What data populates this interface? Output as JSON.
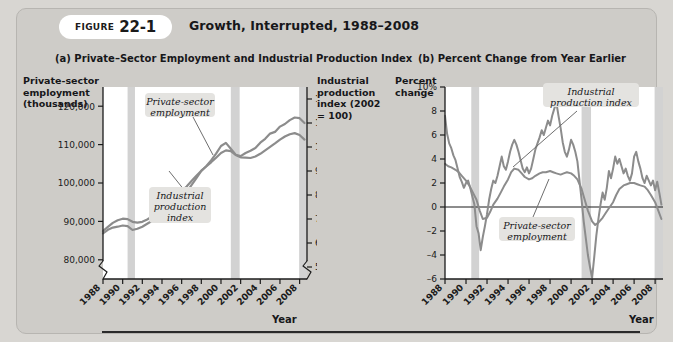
{
  "figure": {
    "label_word": "FIGURE",
    "number": "22-1",
    "title": "Growth, Interrupted, 1988–2008"
  },
  "panel_a": {
    "title": "(a) Private–Sector Employment and Industrial Production Index",
    "left_axis_caption": "Private-sector\nemployment\n(thousands)",
    "right_axis_caption": "Industrial\nproduction\nindex (2002\n= 100)",
    "x_axis_label": "Year",
    "callout_employment": "Private-sector\nemployment",
    "callout_ip": "Industrial\nproduction\nindex"
  },
  "panel_b": {
    "title": "(b) Percent Change from Year Earlier",
    "left_axis_caption": "Percent\nchange",
    "x_axis_label": "Year",
    "callout_ip": "Industrial\nproduction index",
    "callout_employment": "Private-sector\nemployment"
  },
  "colors": {
    "card_background": "#ceccc8",
    "page_background": "#d8d6d2",
    "plot_background": "#ffffff",
    "series_line": "#8c8c8c",
    "recession_band": "#d2d2d2",
    "axis": "#1b1b1b",
    "callout_box": "#e4e3e0"
  },
  "chart_data": [
    {
      "type": "line",
      "title": "(a) Private–Sector Employment and Industrial Production Index",
      "xlabel": "Year",
      "ylabel": "Private-sector employment (thousands)",
      "y2label": "Industrial production index (2002 = 100)",
      "xlim": [
        1988,
        2008.75
      ],
      "ylim": [
        75000,
        125000
      ],
      "y2lim": [
        45,
        125
      ],
      "yticks": [
        80000,
        90000,
        100000,
        110000,
        120000
      ],
      "yticklabels": [
        "80,000",
        "90,000",
        "100,000",
        "110,000",
        "120,000"
      ],
      "y2ticks": [
        50,
        60,
        70,
        80,
        90,
        100,
        110,
        120
      ],
      "y2ticklabels": [
        "50",
        "60",
        "70",
        "80",
        "90",
        "100",
        "110",
        "120"
      ],
      "xticks": [
        1988,
        1990,
        1992,
        1994,
        1996,
        1998,
        2000,
        2002,
        2004,
        2006,
        2008
      ],
      "xticklabels": [
        "1988",
        "1990",
        "1992",
        "1994",
        "1996",
        "1998",
        "2000",
        "2002",
        "2004",
        "2006",
        "2008"
      ],
      "grid": false,
      "axis_break": true,
      "legend": "inline-callout",
      "recession_bands": [
        [
          1990.5,
          1991.25
        ],
        [
          2001.0,
          2001.9
        ],
        [
          2007.95,
          2008.75
        ]
      ],
      "series": [
        {
          "name": "Private-sector employment",
          "axis": "left",
          "x": [
            1988.0,
            1988.5,
            1989.0,
            1989.5,
            1990.0,
            1990.5,
            1991.0,
            1991.5,
            1992.0,
            1992.5,
            1993.0,
            1993.5,
            1994.0,
            1994.5,
            1995.0,
            1995.5,
            1996.0,
            1996.5,
            1997.0,
            1997.5,
            1998.0,
            1998.5,
            1999.0,
            1999.5,
            2000.0,
            2000.5,
            2001.0,
            2001.5,
            2002.0,
            2002.5,
            2003.0,
            2003.5,
            2004.0,
            2004.5,
            2005.0,
            2005.5,
            2006.0,
            2006.5,
            2007.0,
            2007.5,
            2008.0,
            2008.5
          ],
          "y": [
            87500,
            88600,
            89600,
            90300,
            90700,
            90600,
            89900,
            89700,
            89900,
            90500,
            91300,
            92400,
            93600,
            94900,
            96000,
            96900,
            97900,
            99100,
            100500,
            101900,
            103200,
            104300,
            105400,
            106600,
            107800,
            108500,
            108300,
            107300,
            106700,
            106600,
            106500,
            106900,
            107600,
            108500,
            109400,
            110300,
            111300,
            112100,
            112700,
            113000,
            112500,
            111300
          ]
        },
        {
          "name": "Industrial production index",
          "axis": "right",
          "x": [
            1988.0,
            1988.5,
            1989.0,
            1989.5,
            1990.0,
            1990.5,
            1991.0,
            1991.5,
            1992.0,
            1992.5,
            1993.0,
            1993.5,
            1994.0,
            1994.5,
            1995.0,
            1995.5,
            1996.0,
            1996.5,
            1997.0,
            1997.5,
            1998.0,
            1998.5,
            1999.0,
            1999.5,
            2000.0,
            2000.5,
            2001.0,
            2001.5,
            2002.0,
            2002.5,
            2003.0,
            2003.5,
            2004.0,
            2004.5,
            2005.0,
            2005.5,
            2006.0,
            2006.5,
            2007.0,
            2007.5,
            2008.0,
            2008.5
          ],
          "y": [
            64.0,
            65.5,
            66.4,
            66.8,
            67.3,
            67.0,
            65.4,
            65.9,
            66.8,
            68.0,
            69.3,
            70.7,
            72.6,
            74.6,
            76.5,
            77.6,
            79.2,
            81.3,
            84.1,
            87.0,
            90.0,
            92.0,
            94.4,
            97.2,
            100.4,
            101.7,
            99.3,
            96.8,
            96.2,
            97.5,
            98.4,
            99.6,
            101.8,
            103.4,
            105.6,
            106.3,
            108.5,
            109.6,
            111.2,
            112.3,
            112.0,
            110.0
          ]
        }
      ]
    },
    {
      "type": "line",
      "title": "(b) Percent Change from Year Earlier",
      "xlabel": "Year",
      "ylabel": "Percent change",
      "xlim": [
        1988,
        2008.75
      ],
      "ylim": [
        -6,
        10
      ],
      "yticks": [
        -6,
        -4,
        -2,
        0,
        2,
        4,
        6,
        8,
        10
      ],
      "yticklabels": [
        "–6",
        "–4",
        "–2",
        "0",
        "2",
        "4",
        "6",
        "8",
        "10%"
      ],
      "xticks": [
        1988,
        1990,
        1992,
        1994,
        1996,
        1998,
        2000,
        2002,
        2004,
        2006,
        2008
      ],
      "xticklabels": [
        "1988",
        "1990",
        "1992",
        "1994",
        "1996",
        "1998",
        "2000",
        "2002",
        "2004",
        "2006",
        "2008"
      ],
      "grid": false,
      "zero_line": true,
      "legend": "inline-callout",
      "recession_bands": [
        [
          1990.5,
          1991.25
        ],
        [
          2001.0,
          2001.9
        ],
        [
          2007.95,
          2008.75
        ]
      ],
      "series": [
        {
          "name": "Private-sector employment",
          "x": [
            1988.0,
            1988.3,
            1988.6,
            1989.0,
            1989.3,
            1989.6,
            1990.0,
            1990.3,
            1990.6,
            1991.0,
            1991.3,
            1991.6,
            1992.0,
            1992.3,
            1992.6,
            1993.0,
            1993.3,
            1993.6,
            1994.0,
            1994.3,
            1994.6,
            1995.0,
            1995.3,
            1995.6,
            1996.0,
            1996.3,
            1996.6,
            1997.0,
            1997.3,
            1997.6,
            1998.0,
            1998.3,
            1998.6,
            1999.0,
            1999.3,
            1999.6,
            2000.0,
            2000.3,
            2000.6,
            2001.0,
            2001.3,
            2001.6,
            2002.0,
            2002.3,
            2002.6,
            2003.0,
            2003.3,
            2003.6,
            2004.0,
            2004.3,
            2004.6,
            2005.0,
            2005.3,
            2005.6,
            2006.0,
            2006.3,
            2006.6,
            2007.0,
            2007.3,
            2007.6,
            2008.0,
            2008.3,
            2008.6
          ],
          "y": [
            3.6,
            3.4,
            3.3,
            3.1,
            2.9,
            2.6,
            2.2,
            1.8,
            1.3,
            0.6,
            -0.3,
            -1.0,
            -0.9,
            -0.4,
            0.2,
            0.7,
            1.2,
            1.7,
            2.3,
            2.9,
            3.2,
            3.1,
            2.8,
            2.5,
            2.3,
            2.4,
            2.6,
            2.8,
            2.9,
            2.9,
            3.0,
            2.9,
            2.8,
            2.7,
            2.8,
            2.9,
            2.8,
            2.6,
            2.3,
            1.5,
            0.6,
            -0.3,
            -1.2,
            -1.5,
            -1.3,
            -0.9,
            -0.5,
            -0.1,
            0.4,
            1.0,
            1.5,
            1.8,
            1.9,
            2.0,
            2.0,
            1.9,
            1.8,
            1.7,
            1.4,
            1.0,
            0.4,
            -0.3,
            -1.0
          ]
        },
        {
          "name": "Industrial production index",
          "x": [
            1988.0,
            1988.2,
            1988.4,
            1988.6,
            1988.8,
            1989.0,
            1989.2,
            1989.4,
            1989.6,
            1989.8,
            1990.0,
            1990.2,
            1990.4,
            1990.6,
            1990.8,
            1991.0,
            1991.2,
            1991.4,
            1991.6,
            1991.8,
            1992.0,
            1992.2,
            1992.4,
            1992.6,
            1992.8,
            1993.0,
            1993.2,
            1993.4,
            1993.6,
            1993.8,
            1994.0,
            1994.2,
            1994.4,
            1994.6,
            1994.8,
            1995.0,
            1995.2,
            1995.4,
            1995.6,
            1995.8,
            1996.0,
            1996.2,
            1996.4,
            1996.6,
            1996.8,
            1997.0,
            1997.2,
            1997.4,
            1997.6,
            1997.8,
            1998.0,
            1998.2,
            1998.4,
            1998.6,
            1998.8,
            1999.0,
            1999.2,
            1999.4,
            1999.6,
            1999.8,
            2000.0,
            2000.2,
            2000.4,
            2000.6,
            2000.8,
            2001.0,
            2001.2,
            2001.4,
            2001.6,
            2001.8,
            2002.0,
            2002.2,
            2002.4,
            2002.6,
            2002.8,
            2003.0,
            2003.2,
            2003.4,
            2003.6,
            2003.8,
            2004.0,
            2004.2,
            2004.4,
            2004.6,
            2004.8,
            2005.0,
            2005.2,
            2005.4,
            2005.6,
            2005.8,
            2006.0,
            2006.2,
            2006.4,
            2006.6,
            2006.8,
            2007.0,
            2007.2,
            2007.4,
            2007.6,
            2007.8,
            2008.0,
            2008.2,
            2008.4,
            2008.6
          ],
          "y": [
            7.6,
            6.1,
            5.3,
            4.9,
            4.3,
            3.9,
            3.2,
            2.5,
            2.1,
            1.6,
            2.0,
            2.2,
            1.6,
            0.9,
            0.2,
            -1.6,
            -2.2,
            -3.6,
            -2.5,
            -1.6,
            -0.6,
            0.6,
            1.5,
            2.2,
            2.0,
            2.6,
            3.4,
            4.2,
            3.4,
            3.1,
            3.8,
            4.6,
            5.2,
            5.6,
            5.2,
            4.6,
            3.9,
            3.2,
            2.9,
            3.3,
            2.8,
            3.2,
            4.0,
            4.8,
            5.3,
            5.8,
            6.4,
            6.0,
            6.6,
            7.2,
            6.8,
            7.6,
            8.2,
            8.7,
            7.6,
            6.6,
            5.4,
            4.6,
            4.2,
            4.8,
            5.6,
            5.2,
            4.6,
            3.8,
            2.2,
            0.6,
            -1.2,
            -2.6,
            -4.0,
            -5.0,
            -5.9,
            -4.2,
            -2.4,
            -1.0,
            0.2,
            1.2,
            0.6,
            1.6,
            3.0,
            2.4,
            3.2,
            4.2,
            3.6,
            4.0,
            3.4,
            2.8,
            3.2,
            2.6,
            2.2,
            2.8,
            4.2,
            4.6,
            3.8,
            3.2,
            2.4,
            2.0,
            2.6,
            2.2,
            1.8,
            2.2,
            1.4,
            2.1,
            1.2,
            0.2
          ]
        }
      ]
    }
  ]
}
